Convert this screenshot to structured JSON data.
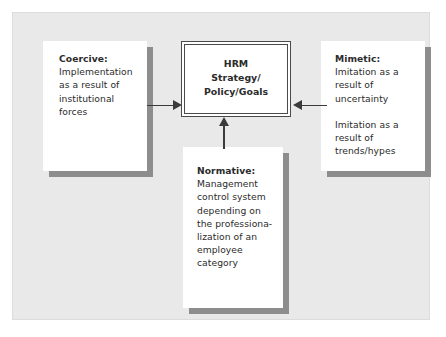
{
  "figure": {
    "background_color": "#e9e9e9",
    "frame_border_color": "#dcdcdc",
    "text_color": "#2b2b2b",
    "shadow_color": "#8d8d8d",
    "arrow_color": "#3a3a3a"
  },
  "center_box": {
    "label": "HRM\nStrategy/\nPolicy/Goals"
  },
  "boxes": {
    "coercive": {
      "heading": "Coercive:",
      "body": "Implementation\nas a result of\ninstitutional\nforces"
    },
    "mimetic": {
      "heading": "Mimetic:",
      "body": "Imitation as a\nresult of\nuncertainty",
      "body2": "Imitation as a\nresult of\ntrends/hypes"
    },
    "normative": {
      "heading": "Normative:",
      "body": "Management\ncontrol system\ndepending on\nthe professiona-\nlization of an\nemployee\ncategory"
    }
  },
  "arrows": [
    {
      "name": "coercive-to-hrm",
      "direction": "right"
    },
    {
      "name": "mimetic-to-hrm",
      "direction": "left"
    },
    {
      "name": "normative-to-hrm",
      "direction": "up"
    }
  ],
  "chart_data": {
    "type": "diagram",
    "nodes": [
      {
        "id": "coercive",
        "label": "Coercive: Implementation as a result of institutional forces",
        "position": "left"
      },
      {
        "id": "hrm",
        "label": "HRM Strategy/Policy/Goals",
        "position": "center"
      },
      {
        "id": "mimetic",
        "label": "Mimetic: Imitation as a result of uncertainty; Imitation as a result of trends/hypes",
        "position": "right"
      },
      {
        "id": "normative",
        "label": "Normative: Management control system depending on the professionalization of an employee category",
        "position": "bottom"
      }
    ],
    "edges": [
      {
        "from": "coercive",
        "to": "hrm"
      },
      {
        "from": "mimetic",
        "to": "hrm"
      },
      {
        "from": "normative",
        "to": "hrm"
      }
    ]
  }
}
